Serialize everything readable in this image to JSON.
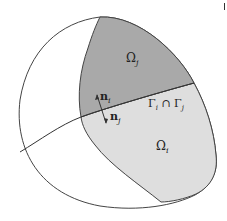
{
  "diagram": {
    "labels": {
      "omega_j": "Ω",
      "omega_j_sub": "j",
      "omega_i": "Ω",
      "omega_i_sub": "i",
      "n_i": "n",
      "n_i_sub": "i",
      "n_j": "n",
      "n_j_sub": "j",
      "interface": "Γ",
      "interface_sub1": "i",
      "interface_cap": " ∩ Γ",
      "interface_sub2": "j"
    },
    "colors": {
      "outline": "#444444",
      "omega_j_fill": "#a9a9a9",
      "omega_i_fill": "#dedede",
      "background": "#ffffff"
    }
  }
}
